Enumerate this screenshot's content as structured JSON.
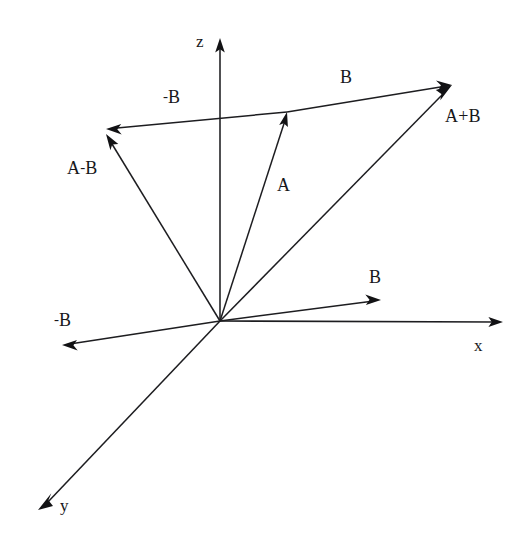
{
  "figure": {
    "background_color": "#ffffff",
    "stroke_color": "#1d1d20",
    "width": 530,
    "height": 546
  },
  "origin": {
    "x": 220,
    "y": 321
  },
  "axes": [
    {
      "name": "z-axis",
      "label": "z",
      "tip": {
        "x": 220,
        "y": 38
      },
      "label_pos": {
        "x": 196,
        "y": 33
      }
    },
    {
      "name": "x-axis",
      "label": "x",
      "tip": {
        "x": 503,
        "y": 322
      },
      "label_pos": {
        "x": 474,
        "y": 337
      }
    },
    {
      "name": "y-axis",
      "label": "y",
      "tip": {
        "x": 38,
        "y": 510
      },
      "label_pos": {
        "x": 60,
        "y": 497
      }
    }
  ],
  "vectors": [
    {
      "name": "vector-a",
      "label": "A",
      "sign": "",
      "from": {
        "x": 220,
        "y": 321
      },
      "to": {
        "x": 287,
        "y": 112
      },
      "label_pos": {
        "x": 277,
        "y": 176
      }
    },
    {
      "name": "vector-a-plus-b",
      "label": "A+B",
      "sign": "",
      "from": {
        "x": 220,
        "y": 321
      },
      "to": {
        "x": 452,
        "y": 85
      },
      "label_pos": {
        "x": 445,
        "y": 107
      }
    },
    {
      "name": "vector-a-minus-b",
      "label": "A-B",
      "sign": "-",
      "parts": {
        "before": "A",
        "after": "B"
      },
      "from": {
        "x": 220,
        "y": 321
      },
      "to": {
        "x": 106,
        "y": 134
      },
      "label_pos": {
        "x": 67,
        "y": 159
      }
    },
    {
      "name": "vector-b-lower",
      "label": "B",
      "sign": "",
      "from": {
        "x": 220,
        "y": 321
      },
      "to": {
        "x": 381,
        "y": 300
      },
      "label_pos": {
        "x": 369,
        "y": 268
      }
    },
    {
      "name": "vector-neg-b-lower",
      "label": "-B",
      "sign": "-",
      "parts": {
        "before": "",
        "after": "B"
      },
      "from": {
        "x": 220,
        "y": 321
      },
      "to": {
        "x": 62,
        "y": 345
      },
      "label_pos": {
        "x": 54,
        "y": 311
      }
    },
    {
      "name": "vector-b-upper",
      "label": "B",
      "sign": "",
      "from": {
        "x": 287,
        "y": 112
      },
      "to": {
        "x": 452,
        "y": 85
      },
      "label_pos": {
        "x": 340,
        "y": 68
      }
    },
    {
      "name": "vector-neg-b-upper",
      "label": "-B",
      "sign": "-",
      "parts": {
        "before": "",
        "after": "B"
      },
      "from": {
        "x": 287,
        "y": 112
      },
      "to": {
        "x": 106,
        "y": 129
      },
      "label_pos": {
        "x": 163,
        "y": 88
      }
    }
  ]
}
